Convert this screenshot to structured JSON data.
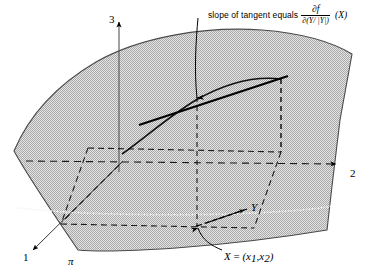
{
  "figure": {
    "surface_label": "π",
    "axes": [
      {
        "name": "axis-1",
        "label": "1"
      },
      {
        "name": "axis-2",
        "label": "2"
      },
      {
        "name": "axis-3",
        "label": "3"
      }
    ],
    "annotations": {
      "slope": {
        "text": "slope of tangent equals",
        "numerator": "∂f",
        "denominator": "∂(Y/ |Y|)",
        "argument": "(X)"
      },
      "point": {
        "text_x": "X",
        "equals": "=",
        "coords": "(x",
        "sub1": "1",
        "comma": ",x",
        "sub2": "2",
        "close": ")"
      },
      "vector": {
        "label": "Y"
      }
    },
    "colors": {
      "surface_fill": "#c9c9c9",
      "surface_stroke": "#3a3a3a",
      "line": "#000000",
      "dashed": "#1a1a1a",
      "background": "#ffffff"
    }
  }
}
